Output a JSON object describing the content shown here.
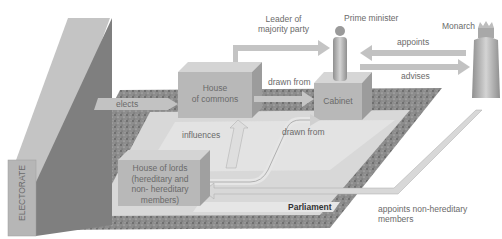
{
  "diagram": {
    "nodes": {
      "electorate": "ELECTORATE",
      "house_of_commons": [
        "House",
        "of commons"
      ],
      "cabinet": "Cabinet",
      "house_of_lords": [
        "House of lords",
        "(hereditary and",
        "non- hereditary",
        "members)"
      ],
      "parliament": "Parliament",
      "prime_minister": "Prime minister",
      "monarch": "Monarch"
    },
    "edges": {
      "elects": "elects",
      "leader_of_majority_party": [
        "Leader of",
        "majority party"
      ],
      "drawn_from_commons": "drawn from",
      "drawn_from_lords": "drawn from",
      "influences": "influences",
      "appoints": "appoints",
      "advises": "advises",
      "appoints_non_hereditary": [
        "appoints non-hereditary",
        "members"
      ]
    },
    "colors": {
      "box_front": "#b4b4b4",
      "box_top": "#d2d2d2",
      "box_side": "#9a9a9a",
      "floor": "#d9d9d9",
      "speckle": "#8a8a8a",
      "arrow": "#bdbdbd",
      "text": "#6a6a6a"
    }
  }
}
